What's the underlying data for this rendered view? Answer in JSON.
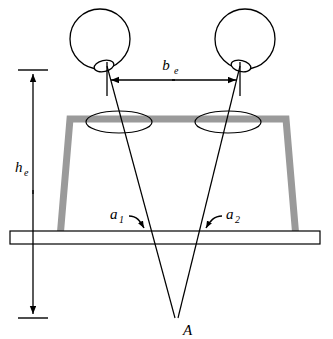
{
  "figure": {
    "background_color": "#ffffff",
    "line_color": "#000000",
    "structure_color": "#9a9a9a",
    "width": 333,
    "height": 339
  },
  "labels": {
    "base_main": "b",
    "base_sub": "e",
    "height_main": "h",
    "height_sub": "e",
    "angle1_main": "a",
    "angle1_sub": "1",
    "angle2_main": "a",
    "angle2_sub": "2",
    "point_a": "A"
  },
  "geometry": {
    "left_eye": {
      "cx": 100,
      "cy": 39,
      "r": 30,
      "lens_cx": 104,
      "lens_cy": 66,
      "lens_rx": 10,
      "lens_ry": 5.5,
      "lens_rotate": -12
    },
    "right_eye": {
      "cx": 245,
      "cy": 39,
      "r": 30,
      "lens_cx": 240,
      "lens_cy": 66,
      "lens_rx": 10,
      "lens_ry": 5.5,
      "lens_rotate": -12
    },
    "baseline": {
      "y": 80,
      "x_left": 107,
      "x_right": 239,
      "tick_top": 63,
      "tick_bottom": 95
    },
    "height_axis": {
      "x": 33,
      "y_top": 70,
      "y_bottom": 318,
      "tick_width": 30
    },
    "ground_plane": {
      "x": 10,
      "y": 231,
      "width": 310,
      "height": 13
    },
    "structure": {
      "top_y": 119,
      "top_left_x": 70,
      "top_right_x": 286,
      "bottom_left_x": 60,
      "bottom_right_x": 296,
      "bottom_y": 238,
      "stroke_width": 7
    },
    "footprint_left": {
      "cx": 119,
      "cy": 122,
      "rx": 33,
      "ry": 11
    },
    "footprint_right": {
      "cx": 228,
      "cy": 122,
      "rx": 33,
      "ry": 11
    },
    "convergence_point": {
      "x": 175,
      "y": 318
    },
    "ray_left_origin": {
      "x": 107,
      "y": 66
    },
    "ray_right_origin": {
      "x": 240,
      "y": 66
    }
  },
  "label_positions": {
    "base": {
      "x": 166,
      "y": 70
    },
    "height": {
      "x": 22,
      "y": 172
    },
    "angle1": {
      "x": 110,
      "y": 218
    },
    "angle2": {
      "x": 226,
      "y": 218
    },
    "point_a": {
      "x": 183,
      "y": 334
    }
  }
}
